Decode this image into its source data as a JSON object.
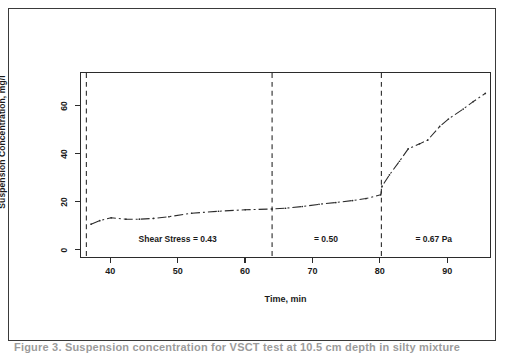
{
  "figure": {
    "caption": "Figure 3. Suspension concentration for VSCT test at 10.5 cm depth in silty mixture"
  },
  "chart_data": {
    "type": "line",
    "title": "",
    "xlabel": "Time, min",
    "ylabel": "Suspension Concentration, mg/l",
    "xlim": [
      35.5,
      96.5
    ],
    "ylim": [
      -2,
      72
    ],
    "xticks": [
      40,
      50,
      60,
      70,
      80,
      90
    ],
    "yticks": [
      0,
      20,
      40,
      60
    ],
    "grid": false,
    "legend": null,
    "line_style": "dash-dot",
    "marker": "point",
    "series": [
      {
        "name": "Suspension Concentration",
        "x": [
          37.0,
          38.3,
          40.0,
          42.2,
          44.2,
          46.3,
          48.6,
          52.0,
          56.0,
          60.0,
          64.0,
          66.0,
          68.5,
          71.0,
          73.5,
          76.0,
          78.0,
          80.2,
          80.4,
          81.5,
          83.0,
          84.3,
          86.0,
          87.2,
          89.0,
          90.3,
          92.5,
          94.0,
          95.8
        ],
        "y": [
          11.2,
          12.6,
          13.8,
          13.2,
          13.2,
          13.5,
          14.2,
          15.6,
          16.4,
          17.0,
          17.3,
          17.6,
          18.3,
          19.2,
          19.9,
          20.7,
          21.5,
          23.0,
          26.5,
          31.0,
          36.5,
          41.5,
          43.5,
          45.0,
          50.5,
          53.5,
          57.5,
          60.5,
          63.8
        ]
      }
    ],
    "vlines": [
      {
        "x": 36.3,
        "style": "dashed"
      },
      {
        "x": 64.0,
        "style": "dashed"
      },
      {
        "x": 80.3,
        "style": "dashed"
      }
    ],
    "annotations": [
      {
        "text": "Shear Stress = 0.43",
        "x": 50.0,
        "y": 5.0
      },
      {
        "text": "= 0.50",
        "x": 72.0,
        "y": 5.0
      },
      {
        "text": "= 0.67 Pa",
        "x": 88.0,
        "y": 5.0
      }
    ]
  }
}
